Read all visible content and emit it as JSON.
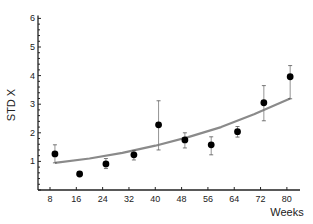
{
  "chart_data": {
    "type": "scatter",
    "title": "",
    "xlabel": "Weeks",
    "ylabel": "STD X",
    "xlim": [
      4,
      84
    ],
    "ylim": [
      0,
      6.1
    ],
    "x_ticks": [
      8,
      16,
      24,
      32,
      40,
      48,
      56,
      64,
      72,
      80
    ],
    "y_ticks": [
      1,
      2,
      3,
      4,
      5,
      6
    ],
    "grid": false,
    "legend": null,
    "series": [
      {
        "name": "observed",
        "style": "black filled circles with error bars",
        "x": [
          9.5,
          17,
          25,
          33.5,
          41,
          49,
          57,
          65,
          73,
          81
        ],
        "y": [
          1.26,
          0.56,
          0.91,
          1.23,
          2.28,
          1.75,
          1.58,
          2.04,
          3.05,
          3.96
        ],
        "err_low": [
          0.95,
          null,
          0.75,
          1.05,
          1.4,
          1.47,
          1.23,
          1.85,
          2.42,
          3.19
        ],
        "err_high": [
          1.58,
          null,
          1.1,
          1.38,
          3.12,
          2.0,
          1.86,
          2.22,
          3.65,
          4.35
        ]
      },
      {
        "name": "fitted curve",
        "style": "gray line",
        "x": [
          9.5,
          20,
          30,
          40,
          50,
          60,
          70,
          81
        ],
        "y": [
          0.95,
          1.1,
          1.3,
          1.55,
          1.85,
          2.2,
          2.65,
          3.2
        ]
      }
    ]
  }
}
